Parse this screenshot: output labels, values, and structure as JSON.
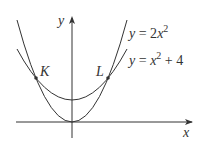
{
  "diagram": {
    "axes": {
      "x_label": "x",
      "y_label": "y"
    },
    "curves": [
      {
        "name": "upper-parabola",
        "equation_parts": [
          "y",
          " = 2",
          "x",
          "2"
        ],
        "label": "y = 2x^2",
        "formula": "2x^2"
      },
      {
        "name": "lower-parabola",
        "equation_parts": [
          "y",
          " = ",
          "x",
          "2",
          " + 4"
        ],
        "label": "y = x^2 + 4",
        "formula": "x^2 + 4"
      }
    ],
    "points": [
      {
        "label": "K",
        "x": -2,
        "y": 8
      },
      {
        "label": "L",
        "x": 2,
        "y": 8
      }
    ],
    "line_color": "#333333"
  }
}
